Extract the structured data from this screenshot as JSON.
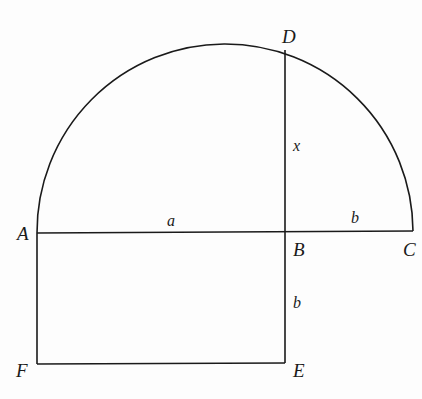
{
  "diagram": {
    "points": {
      "A": {
        "label": "A",
        "x": 37,
        "y": 233
      },
      "B": {
        "label": "B",
        "x": 285,
        "y": 232
      },
      "C": {
        "label": "C",
        "x": 413,
        "y": 231
      },
      "D": {
        "label": "D",
        "x": 285,
        "y": 50
      },
      "E": {
        "label": "E",
        "x": 285,
        "y": 363
      },
      "F": {
        "label": "F",
        "x": 37,
        "y": 364
      }
    },
    "segments": {
      "AB": {
        "label": "a"
      },
      "BC": {
        "label": "b"
      },
      "BD": {
        "label": "x"
      },
      "BE": {
        "label": "b"
      }
    },
    "stroke_color": "#1a1a1a"
  }
}
